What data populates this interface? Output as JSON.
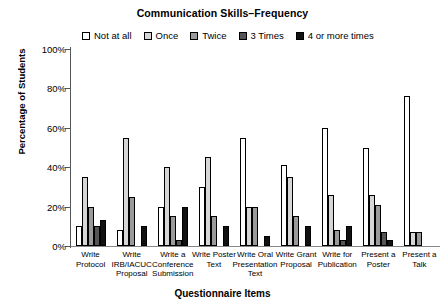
{
  "chart_data": {
    "type": "bar",
    "title": "Communication Skills–Frequency",
    "xlabel": "Questionnaire Items",
    "ylabel": "Percentage of Students",
    "ylim": [
      0,
      100
    ],
    "ytick_labels": [
      "0%",
      "20%",
      "40%",
      "60%",
      "80%",
      "100%"
    ],
    "ytick_values": [
      0,
      20,
      40,
      60,
      80,
      100
    ],
    "grid": false,
    "legend_position": "top",
    "categories": [
      "Write Protocol",
      "Write IRB/IACUC Proposal",
      "Write a Conference Submission",
      "Write Poster Text",
      "Write Oral Presentation Text",
      "Write Grant Proposal",
      "Write for Publication",
      "Present a Poster",
      "Present a Talk"
    ],
    "category_lines": [
      [
        "Write",
        "Protocol"
      ],
      [
        "Write",
        "IRB/IACUC",
        "Proposal"
      ],
      [
        "Write a",
        "Conference",
        "Submission"
      ],
      [
        "Write Poster",
        "Text"
      ],
      [
        "Write Oral",
        "Presentation",
        "Text"
      ],
      [
        "Write Grant",
        "Proposal"
      ],
      [
        "Write for",
        "Publication"
      ],
      [
        "Present a",
        "Poster"
      ],
      [
        "Present a",
        "Talk"
      ]
    ],
    "series": [
      {
        "name": "Not at all",
        "color": "#ffffff",
        "values": [
          10,
          8,
          20,
          30,
          55,
          41,
          60,
          50,
          76
        ]
      },
      {
        "name": "Once",
        "color": "#d6d6d6",
        "values": [
          35,
          55,
          40,
          45,
          20,
          35,
          26,
          26,
          7
        ]
      },
      {
        "name": "Twice",
        "color": "#9a9a9a",
        "values": [
          20,
          25,
          15,
          15,
          20,
          15,
          8,
          21,
          7
        ]
      },
      {
        "name": "3 Times",
        "color": "#555555",
        "values": [
          10,
          0,
          3,
          0,
          0,
          0,
          3,
          7,
          0
        ]
      },
      {
        "name": "4 or more times",
        "color": "#111111",
        "values": [
          13,
          10,
          20,
          10,
          5,
          10,
          10,
          3,
          0
        ]
      }
    ]
  }
}
